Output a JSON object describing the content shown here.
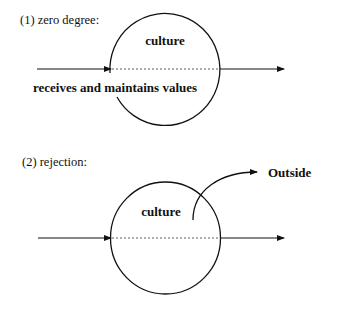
{
  "diagrams": [
    {
      "title": "(1) zero degree:",
      "circle_label": "culture",
      "caption": "receives and maintains values"
    },
    {
      "title": "(2) rejection:",
      "circle_label": "culture",
      "outside_label": "Outside"
    }
  ],
  "colors": {
    "stroke": "#111111",
    "background": "#ffffff"
  }
}
